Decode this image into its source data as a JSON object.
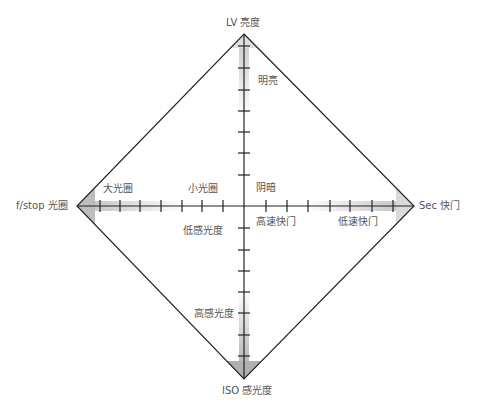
{
  "diagram": {
    "type": "exposure-diamond",
    "colors": {
      "line": "#222222",
      "shade": "#bbbbbb",
      "text": "#555555"
    },
    "axes": {
      "top": {
        "label": "LV 亮度",
        "near_label": "明亮",
        "far_label": "阴暗"
      },
      "left": {
        "label": "f/stop 光圈",
        "near_label": "大光圈",
        "far_label": "小光圈"
      },
      "right": {
        "label": "Sec 快门",
        "near_label": "低速快门",
        "far_label": "高速快门"
      },
      "bottom": {
        "label": "ISO 感光度",
        "near_label": "高感光度",
        "far_label": "低感光度"
      }
    }
  }
}
